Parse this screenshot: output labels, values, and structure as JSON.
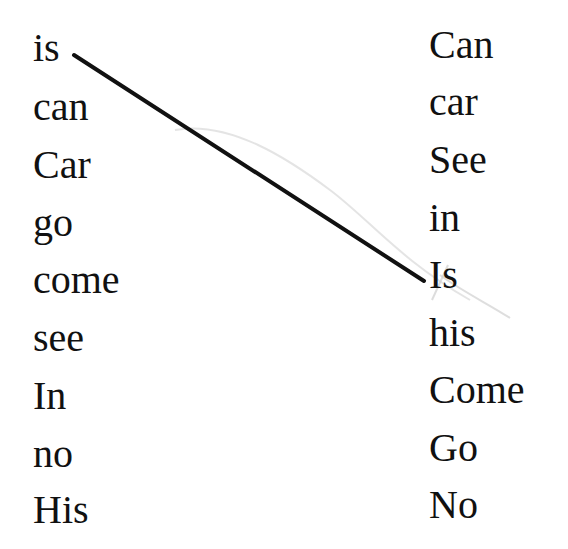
{
  "worksheet": {
    "left_column": [
      "is",
      "can",
      "Car",
      "go",
      "come",
      "see",
      "In",
      "no",
      "His"
    ],
    "right_column": [
      "Can",
      "car",
      "See",
      "in",
      "Is",
      "his",
      "Come",
      "Go",
      "No"
    ],
    "drawn_lines": [
      {
        "from": "is",
        "to": "Is",
        "color": "#111111"
      }
    ]
  }
}
